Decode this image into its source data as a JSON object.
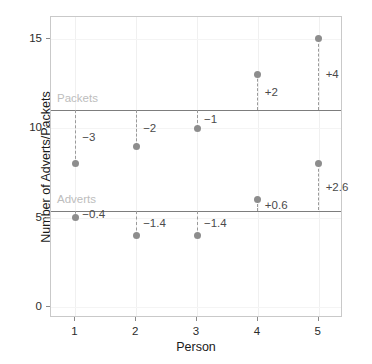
{
  "chart_data": {
    "type": "scatter",
    "title": "",
    "xlabel": "Person",
    "ylabel": "Number of Adverts/Packets",
    "xlim": [
      0.6,
      5.4
    ],
    "ylim": [
      -0.6,
      16.2
    ],
    "xticks": [
      "1",
      "2",
      "3",
      "4",
      "5"
    ],
    "xtick_values": [
      1,
      2,
      3,
      4,
      5
    ],
    "yticks": [
      "0",
      "5",
      "10",
      "15"
    ],
    "ytick_values": [
      0,
      5,
      10,
      15
    ],
    "grid": true,
    "legend": "none",
    "reference_lines": [
      {
        "label": "Packets",
        "value": 11.0
      },
      {
        "label": "Adverts",
        "value": 5.4
      }
    ],
    "series": [
      {
        "name": "Packets",
        "mean": 11.0,
        "x": [
          1,
          2,
          3,
          4,
          5
        ],
        "values": [
          8,
          9,
          10,
          13,
          15
        ],
        "residual_labels": [
          "−3",
          "−2",
          "−1",
          "+2",
          "+4"
        ]
      },
      {
        "name": "Adverts",
        "mean": 5.4,
        "x": [
          1,
          2,
          3,
          4,
          5
        ],
        "values": [
          5,
          4,
          4,
          6,
          8
        ],
        "residual_labels": [
          "−0.4",
          "−1.4",
          "−1.4",
          "+0.6",
          "+2.6"
        ]
      }
    ],
    "colors": {
      "point": "#8d8d8d",
      "dashed_line": "#9a9a9a",
      "reference_line": "#7d7d7d",
      "reference_label": "#bdbdbd",
      "delta_label": "#4a4a4a",
      "panel_border": "#c9c9c9",
      "background": "#ffffff"
    }
  }
}
